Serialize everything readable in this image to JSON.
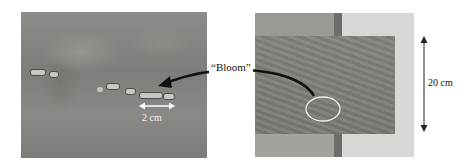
{
  "figure": {
    "left_photo": {
      "description": "Close-up of bloom defect on surface",
      "scale_bar_label": "2 cm"
    },
    "callout_label": "“Bloom”",
    "right_photo": {
      "description": "Full sample panel with bloom region circled",
      "dimension_label": "20 cm"
    },
    "colors": {
      "arrow": "#111111",
      "highlight_circle": "#f2f2f2",
      "scale_bar": "#ffffff"
    }
  }
}
